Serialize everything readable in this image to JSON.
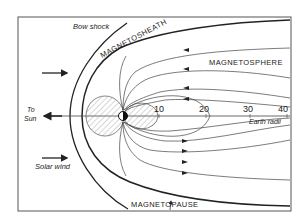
{
  "diagram": {
    "labels": {
      "bow_shock": "Bow shock",
      "magnetosheath": "MAGNETOSHEATH",
      "magnetosphere": "MAGNETOSPHERE",
      "magnetopause": "MAGNETOPAUSE",
      "to_sun_line1": "To",
      "to_sun_line2": "Sun",
      "solar_wind": "Solar wind",
      "earth_radii": "Earth radii"
    },
    "axis_ticks": [
      "10",
      "20",
      "30",
      "40"
    ],
    "colors": {
      "line": "#222222",
      "hatch": "#888888",
      "frame": "#555555"
    }
  }
}
